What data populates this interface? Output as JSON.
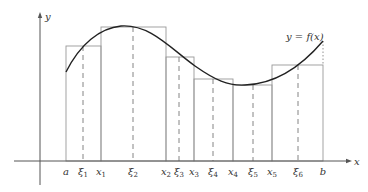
{
  "diagram": {
    "curve_label": "y = f(x)",
    "axis_labels": {
      "x": "x",
      "y": "y"
    },
    "colors": {
      "curve": "#222222",
      "rect": "#999999",
      "axis": "#555555"
    },
    "axis": {
      "origin_x": 40,
      "axis_y": 161,
      "x_end": 352,
      "y_top": 12,
      "y_bottom": 185
    },
    "ticks": [
      {
        "label": "a",
        "sub": "",
        "x": 66,
        "kind": "solid"
      },
      {
        "label": "ξ",
        "sub": "1",
        "x": 83,
        "kind": "dashed"
      },
      {
        "label": "x",
        "sub": "1",
        "x": 101,
        "kind": "solid"
      },
      {
        "label": "ξ",
        "sub": "2",
        "x": 133,
        "kind": "dashed"
      },
      {
        "label": "x",
        "sub": "2",
        "x": 166,
        "kind": "solid"
      },
      {
        "label": "ξ",
        "sub": "3",
        "x": 179,
        "kind": "dashed"
      },
      {
        "label": "x",
        "sub": "3",
        "x": 194,
        "kind": "solid"
      },
      {
        "label": "ξ",
        "sub": "4",
        "x": 213,
        "kind": "dashed"
      },
      {
        "label": "x",
        "sub": "4",
        "x": 233,
        "kind": "solid"
      },
      {
        "label": "ξ",
        "sub": "5",
        "x": 253,
        "kind": "dashed"
      },
      {
        "label": "x",
        "sub": "5",
        "x": 272,
        "kind": "solid"
      },
      {
        "label": "ξ",
        "sub": "6",
        "x": 298,
        "kind": "dashed"
      },
      {
        "label": "b",
        "sub": "",
        "x": 323,
        "kind": "solid"
      }
    ],
    "rectangles": [
      {
        "x0": 66,
        "x1": 101,
        "top": 46
      },
      {
        "x0": 101,
        "x1": 166,
        "top": 27
      },
      {
        "x0": 166,
        "x1": 194,
        "top": 57
      },
      {
        "x0": 194,
        "x1": 233,
        "top": 79
      },
      {
        "x0": 233,
        "x1": 272,
        "top": 85
      },
      {
        "x0": 272,
        "x1": 323,
        "top": 65
      }
    ],
    "curve_path": "M66,72 C80,44 100,28 121,26 C150,24 170,48 195,66 C215,80 228,86 245,85 C275,84 300,68 323,41",
    "curve_label_pos": {
      "x": 286,
      "y": 40
    }
  }
}
